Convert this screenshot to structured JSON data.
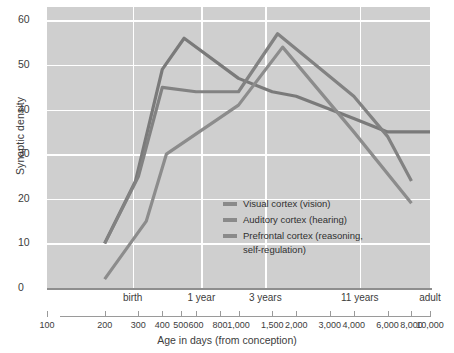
{
  "chart_data": {
    "type": "line",
    "title": "",
    "xlabel": "Age in days (from conception)",
    "ylabel": "Synaptic density",
    "xscale": "log",
    "xlim": [
      100,
      10000
    ],
    "ylim": [
      0,
      63
    ],
    "yticks": [
      0,
      10,
      20,
      30,
      40,
      50,
      60
    ],
    "xticks": [
      100,
      200,
      300,
      400,
      500,
      600,
      800,
      1000,
      1500,
      2000,
      3000,
      4000,
      6000,
      8000,
      10000
    ],
    "xtick_labels": [
      "100",
      "200",
      "300",
      "400",
      "500",
      "600",
      "800",
      "1,000",
      "1,500",
      "2,000",
      "3,000",
      "4,000",
      "6,000",
      "8,000",
      "10,000"
    ],
    "era_labels": [
      {
        "label": "birth",
        "x": 280
      },
      {
        "label": "1 year",
        "x": 640
      },
      {
        "label": "3 years",
        "x": 1380
      },
      {
        "label": "11 years",
        "x": 4300
      },
      {
        "label": "adult",
        "x": 10000
      }
    ],
    "gridlines": {
      "horizontal": true,
      "vertical": true,
      "vertical_at": [
        280,
        640,
        1380,
        4300
      ]
    },
    "legend_position": "center-left-inside",
    "series": [
      {
        "name": "Visual cortex (vision)",
        "color": "#7a7a7a",
        "points": [
          {
            "x": 200,
            "y": 10
          },
          {
            "x": 290,
            "y": 24
          },
          {
            "x": 400,
            "y": 49
          },
          {
            "x": 520,
            "y": 56
          },
          {
            "x": 1000,
            "y": 47
          },
          {
            "x": 1500,
            "y": 44
          },
          {
            "x": 2000,
            "y": 43
          },
          {
            "x": 4000,
            "y": 38
          },
          {
            "x": 6000,
            "y": 35
          },
          {
            "x": 10000,
            "y": 35
          }
        ]
      },
      {
        "name": "Auditory cortex (hearing)",
        "color": "#828282",
        "points": [
          {
            "x": 200,
            "y": 10
          },
          {
            "x": 300,
            "y": 25
          },
          {
            "x": 400,
            "y": 45
          },
          {
            "x": 600,
            "y": 44
          },
          {
            "x": 1000,
            "y": 44
          },
          {
            "x": 1600,
            "y": 57
          },
          {
            "x": 4000,
            "y": 43
          },
          {
            "x": 6000,
            "y": 34
          },
          {
            "x": 8000,
            "y": 24
          }
        ]
      },
      {
        "name": "Prefrontal cortex (reasoning,\nself-regulation)",
        "color": "#8c8c8c",
        "points": [
          {
            "x": 200,
            "y": 2
          },
          {
            "x": 330,
            "y": 15
          },
          {
            "x": 420,
            "y": 30
          },
          {
            "x": 1000,
            "y": 41
          },
          {
            "x": 1700,
            "y": 54
          },
          {
            "x": 4000,
            "y": 35
          },
          {
            "x": 8000,
            "y": 19
          }
        ]
      }
    ]
  },
  "legend": {
    "items": [
      {
        "label": "Visual cortex (vision)"
      },
      {
        "label": "Auditory cortex (hearing)"
      },
      {
        "label": "Prefrontal cortex (reasoning,\nself-regulation)"
      }
    ]
  }
}
